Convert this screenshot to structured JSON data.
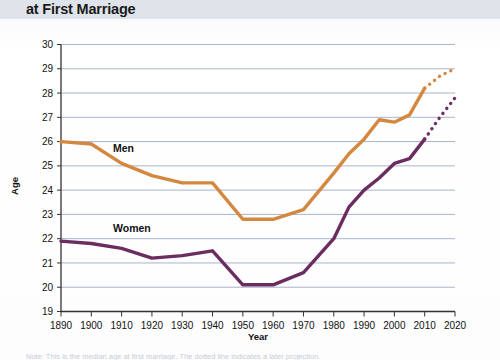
{
  "header": {
    "title": "at First Marriage"
  },
  "axes": {
    "ylabel": "Age",
    "xlabel": "Year",
    "yticks": [
      "30",
      "29",
      "28",
      "27",
      "26",
      "25",
      "24",
      "23",
      "22",
      "21",
      "20",
      "19"
    ],
    "xticks": [
      "1890",
      "1900",
      "1910",
      "1920",
      "1930",
      "1940",
      "1950",
      "1960",
      "1970",
      "1980",
      "1990",
      "2000",
      "2010",
      "2020"
    ]
  },
  "labels": {
    "men": "Men",
    "women": "Women"
  },
  "footnote": {
    "text": "Note: This is the median age at first marriage. The dotted line indicates a later projection."
  },
  "colors": {
    "men": "#D4873F",
    "women": "#6B2C5F",
    "grid": "#9aa6c4",
    "axis": "#333333",
    "header_band": "#dfe4ea"
  },
  "chart_data": {
    "type": "line",
    "title": "at First Marriage",
    "xlabel": "Year",
    "ylabel": "Age",
    "xlim": [
      1890,
      2020
    ],
    "ylim": [
      19,
      30
    ],
    "grid": true,
    "legend": "inline-labels",
    "x": [
      1890,
      1900,
      1910,
      1920,
      1930,
      1940,
      1950,
      1960,
      1970,
      1980,
      1985,
      1990,
      1995,
      2000,
      2005,
      2010
    ],
    "series": [
      {
        "name": "Men",
        "color": "#D4873F",
        "values": [
          26.0,
          25.9,
          25.1,
          24.6,
          24.3,
          24.3,
          22.8,
          22.8,
          23.2,
          24.7,
          25.5,
          26.1,
          26.9,
          26.8,
          27.1,
          28.2
        ],
        "projection": {
          "style": "dotted",
          "x": [
            2010,
            2015,
            2020
          ],
          "values": [
            28.2,
            28.7,
            29.0
          ]
        }
      },
      {
        "name": "Women",
        "color": "#6B2C5F",
        "values": [
          21.9,
          21.8,
          21.6,
          21.2,
          21.3,
          21.5,
          20.1,
          20.1,
          20.6,
          22.0,
          23.3,
          24.0,
          24.5,
          25.1,
          25.3,
          26.1
        ],
        "projection": {
          "style": "dotted",
          "x": [
            2010,
            2015,
            2020
          ],
          "values": [
            26.1,
            27.0,
            27.8
          ]
        }
      }
    ]
  }
}
